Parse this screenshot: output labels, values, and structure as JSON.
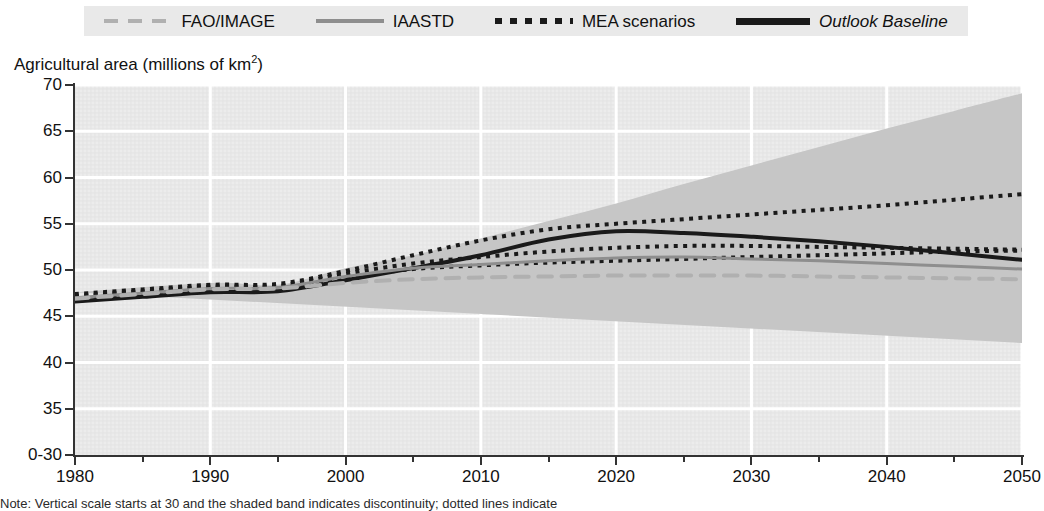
{
  "legend": {
    "items": [
      {
        "label": "FAO/IMAGE",
        "style": "dashed",
        "color": "#b0b0b0",
        "italic": false
      },
      {
        "label": "IAASTD",
        "style": "solid-gray",
        "color": "#8e8e8e",
        "italic": false
      },
      {
        "label": "MEA scenarios",
        "style": "dotted",
        "color": "#1a1a1a",
        "italic": false
      },
      {
        "label": "Outlook Baseline",
        "style": "solid-black",
        "color": "#1a1a1a",
        "italic": true
      }
    ]
  },
  "axis_title": "Agricultural area (millions of km",
  "axis_title_sup": "2",
  "axis_title_close": ")",
  "y_labels": [
    "70",
    "65",
    "60",
    "55",
    "50",
    "45",
    "40",
    "35",
    "0-30"
  ],
  "x_labels": [
    "1980",
    "1990",
    "2000",
    "2010",
    "2020",
    "2030",
    "2040",
    "2050"
  ],
  "caption": "Note: Vertical scale starts at 30 and the shaded band indicates discontinuity; dotted lines indicate",
  "colors": {
    "plot_background": "#ececec",
    "gridline": "#ffffff",
    "band": "#c6c6c6",
    "baseline": "#1a1a1a",
    "mea": "#1a1a1a",
    "iaastd": "#8e8e8e",
    "fao": "#b0b0b0",
    "axis": "#333333"
  },
  "chart_data": {
    "type": "line",
    "title": "",
    "xlabel": "",
    "ylabel": "Agricultural area (millions of km2)",
    "xlim": [
      1980,
      2050
    ],
    "ylim": [
      30,
      70
    ],
    "yticks": [
      30,
      35,
      40,
      45,
      50,
      55,
      60,
      65,
      70
    ],
    "xticks": [
      1980,
      1990,
      2000,
      2010,
      2020,
      2030,
      2040,
      2050
    ],
    "grid": true,
    "legend_position": "top",
    "uncertainty_band": {
      "name": "Scenario range",
      "color": "#c6c6c6",
      "x": [
        1980,
        1990,
        1995,
        2000,
        2005,
        2010,
        2015,
        2020,
        2025,
        2030,
        2035,
        2040,
        2045,
        2050
      ],
      "upper": [
        47.6,
        48.6,
        48.4,
        50.2,
        51.6,
        53.4,
        55.3,
        57.2,
        59.3,
        61.3,
        63.3,
        65.3,
        67.2,
        69.1
      ],
      "lower": [
        46.3,
        47.3,
        47.4,
        48.8,
        49.5,
        50.1,
        50.3,
        50.2,
        49.8,
        49.2,
        48.0,
        46.4,
        44.3,
        42.1
      ]
    },
    "series": [
      {
        "name": "Outlook Baseline",
        "color": "#1a1a1a",
        "style": "solid",
        "width": 4,
        "x": [
          1980,
          1985,
          1990,
          1995,
          2000,
          2005,
          2010,
          2015,
          2020,
          2025,
          2030,
          2035,
          2040,
          2045,
          2050
        ],
        "values": [
          46.6,
          47.1,
          47.6,
          47.7,
          48.9,
          50.2,
          51.6,
          53.3,
          54.2,
          54.0,
          53.6,
          53.1,
          52.5,
          51.8,
          51.1
        ]
      },
      {
        "name": "MEA scenarios (high)",
        "color": "#1a1a1a",
        "style": "dotted",
        "width": 4,
        "x": [
          1980,
          1985,
          1990,
          1995,
          2000,
          2005,
          2010,
          2015,
          2020,
          2025,
          2030,
          2035,
          2040,
          2045,
          2050
        ],
        "values": [
          47.4,
          47.9,
          48.4,
          48.5,
          49.9,
          51.6,
          53.2,
          54.4,
          55.0,
          55.5,
          56.0,
          56.5,
          57.0,
          57.6,
          58.2
        ]
      },
      {
        "name": "MEA scenarios (mid)",
        "color": "#1a1a1a",
        "style": "dotted",
        "width": 4,
        "x": [
          1980,
          1985,
          1990,
          1995,
          2000,
          2005,
          2010,
          2015,
          2020,
          2025,
          2030,
          2035,
          2040,
          2045,
          2050
        ],
        "values": [
          47.2,
          47.7,
          48.2,
          48.3,
          49.6,
          50.7,
          51.4,
          52.0,
          52.4,
          52.6,
          52.6,
          52.5,
          52.4,
          52.3,
          52.2
        ]
      },
      {
        "name": "MEA scenarios (low)",
        "color": "#1a1a1a",
        "style": "dotted",
        "width": 4,
        "x": [
          1980,
          1985,
          1990,
          1995,
          2000,
          2005,
          2010,
          2015,
          2020,
          2025,
          2030,
          2035,
          2040,
          2045,
          2050
        ],
        "values": [
          47.0,
          47.5,
          48.0,
          48.1,
          49.2,
          50.1,
          50.5,
          50.8,
          51.0,
          51.2,
          51.4,
          51.6,
          51.8,
          52.0,
          52.1
        ]
      },
      {
        "name": "IAASTD",
        "color": "#8e8e8e",
        "style": "solid",
        "width": 3,
        "x": [
          1980,
          1985,
          1990,
          1995,
          2000,
          2005,
          2010,
          2015,
          2020,
          2025,
          2030,
          2035,
          2040,
          2045,
          2050
        ],
        "values": [
          47.0,
          47.5,
          48.0,
          48.1,
          49.3,
          50.2,
          50.6,
          51.0,
          51.3,
          51.4,
          51.2,
          51.0,
          50.7,
          50.4,
          50.1
        ]
      },
      {
        "name": "FAO/IMAGE",
        "color": "#b0b0b0",
        "style": "dashed",
        "width": 4,
        "x": [
          1980,
          1985,
          1990,
          1995,
          2000,
          2005,
          2010,
          2015,
          2020,
          2025,
          2030,
          2035,
          2040,
          2045,
          2050
        ],
        "values": [
          46.9,
          47.4,
          47.9,
          48.0,
          48.6,
          49.0,
          49.2,
          49.3,
          49.4,
          49.4,
          49.4,
          49.3,
          49.2,
          49.1,
          49.0
        ]
      }
    ]
  }
}
